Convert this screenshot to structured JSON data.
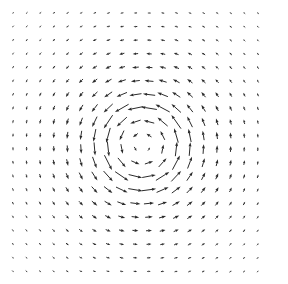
{
  "figure": {
    "title": "",
    "width": 288,
    "height": 284,
    "background_color": "#ffffff",
    "arrow_color": "#2b2b2b"
  },
  "chart_data": {
    "type": "quiver",
    "title": "",
    "subtitle": "",
    "xlabel": "",
    "ylabel": "",
    "legend": [],
    "annotations": [],
    "grid": false,
    "axes_visible": false,
    "tick_labels_x": [],
    "tick_labels_y": [],
    "xlim": [
      0,
      288
    ],
    "ylim": [
      0,
      284
    ],
    "field": {
      "kind": "vortex",
      "rotation": "counter-clockwise",
      "center_px": [
        143,
        145
      ],
      "core_radius_px": 9,
      "peak_radius_px": 40,
      "falloff_radius_px": 95,
      "max_arrow_length_px": 17,
      "min_arrow_length_px": 1.5,
      "head_length_px": 4.2,
      "head_width_px": 2.9,
      "shaft_width_px": 1.0
    },
    "sampling": {
      "cols": 19,
      "rows": 20,
      "x_start_px": 13,
      "y_start_px": 13,
      "x_step_px": 13.6,
      "y_step_px": 13.6
    }
  }
}
